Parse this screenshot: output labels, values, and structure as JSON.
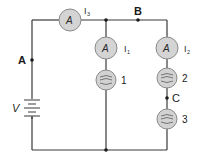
{
  "diagram": {
    "type": "circuit",
    "points": {
      "A": "A",
      "B": "B",
      "C": "C"
    },
    "source": {
      "label": "V"
    },
    "ammeters": [
      {
        "symbol": "A",
        "current": "I",
        "subscript": "3"
      },
      {
        "symbol": "A",
        "current": "I",
        "subscript": "1"
      },
      {
        "symbol": "A",
        "current": "I",
        "subscript": "2"
      }
    ],
    "bulbs": [
      {
        "label": "1"
      },
      {
        "label": "2"
      },
      {
        "label": "3"
      }
    ],
    "colors": {
      "wire": "#3a3a3a",
      "component_fill": "#d4d4d4",
      "component_stroke": "#8a8a8a"
    }
  }
}
